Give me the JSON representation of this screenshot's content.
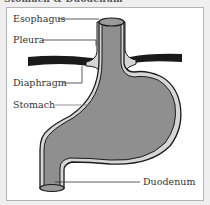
{
  "title": "Stomach & Duodenum",
  "labels": {
    "esophagus": "Esophagus",
    "pleura": "Pleura",
    "diaphragm": "Diaphragm",
    "stomach": "Stomach",
    "duodenum": "Duodenum"
  },
  "colors": {
    "background": "#efefef",
    "panel": "#ffffff",
    "organ_fill": "#8f8f8f",
    "organ_wall": "#d6d6d6",
    "outline": "#1a1a1a",
    "diaphragm": "#1a1a1a"
  }
}
